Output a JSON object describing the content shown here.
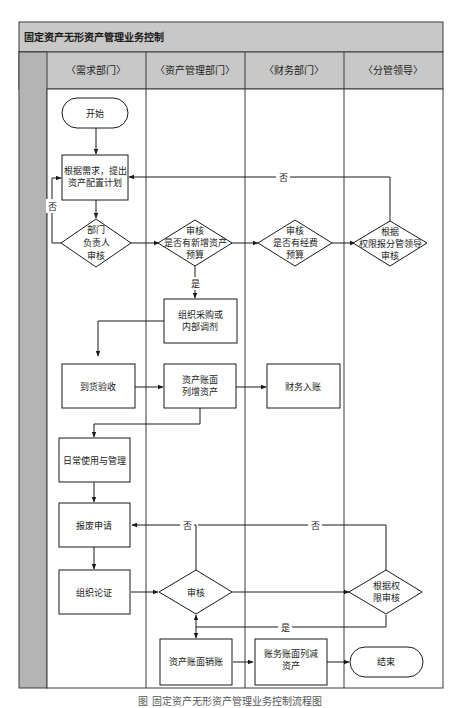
{
  "title": "固定资产无形资产管理业务控制",
  "lanes": [
    {
      "label": "〈需求部门〉"
    },
    {
      "label": "〈资产管理部门〉"
    },
    {
      "label": "〈财务部门〉"
    },
    {
      "label": "〈分管领导〉"
    }
  ],
  "nodes": {
    "start": "开始",
    "plan_l1": "根据需求，提出",
    "plan_l2": "资产配置计划",
    "dept_review_l1": "部门",
    "dept_review_l2": "负责人",
    "dept_review_l3": "审核",
    "asset_budget_l1": "审核",
    "asset_budget_l2": "是否有新增资产",
    "asset_budget_l3": "预算",
    "fund_budget_l1": "审核",
    "fund_budget_l2": "是否有经费",
    "fund_budget_l3": "预算",
    "leader_review_l1": "根据",
    "leader_review_l2": "权限报分管领导",
    "leader_review_l3": "审核",
    "purchase_l1": "组织采购或",
    "purchase_l2": "内部调剂",
    "acceptance": "到货验收",
    "ledger_add_l1": "资产账面",
    "ledger_add_l2": "列增资产",
    "finance_entry": "财务入账",
    "daily_use": "日常使用与管理",
    "scrap_request": "报废申请",
    "demonstration": "组织论证",
    "review": "审核",
    "authority_review_l1": "根据权",
    "authority_review_l2": "限审核",
    "writeoff": "资产账面销账",
    "finance_reduce_l1": "账务账面列减",
    "finance_reduce_l2": "资产",
    "end": "结束"
  },
  "edge_labels": {
    "no_left": "否",
    "no_top": "否",
    "yes_mid": "是",
    "no_scrap_1": "否",
    "no_scrap_2": "否",
    "yes_bottom": "是"
  },
  "caption": "图  固定资产无形资产管理业务控制流程图",
  "colors": {
    "header_bg": "#c8c8c8",
    "side_strip": "#b4b4b4",
    "line": "#1a1a1a",
    "border": "#3a3a3a"
  }
}
